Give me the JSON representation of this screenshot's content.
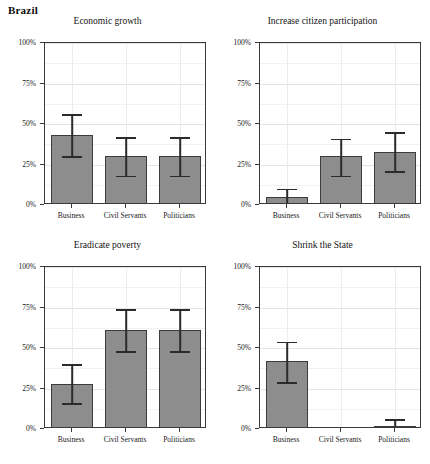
{
  "figure": {
    "country_title": "Brazil"
  },
  "axis": {
    "y_ticks": [
      "0%",
      "25%",
      "50%",
      "75%",
      "100%"
    ],
    "y_values": [
      0,
      25,
      50,
      75,
      100
    ],
    "categories": [
      "Business",
      "Civil Servants",
      "Politicians"
    ]
  },
  "panels": [
    {
      "id": "economic-growth",
      "title": "Economic growth",
      "values": [
        43,
        30,
        30
      ],
      "ci_low": [
        30,
        18,
        18
      ],
      "ci_high": [
        56,
        42,
        42
      ]
    },
    {
      "id": "increase-citizen-participation",
      "title": "Increase citizen participation",
      "values": [
        5,
        30,
        33
      ],
      "ci_low": [
        0,
        18,
        21
      ],
      "ci_high": [
        10,
        41,
        45
      ]
    },
    {
      "id": "eradicate-poverty",
      "title": "Eradicate poverty",
      "values": [
        28,
        61,
        61
      ],
      "ci_low": [
        16,
        48,
        48
      ],
      "ci_high": [
        40,
        74,
        74
      ]
    },
    {
      "id": "shrink-the-state",
      "title": "Shrink the State",
      "values": [
        42,
        0,
        2
      ],
      "ci_low": [
        29,
        0,
        0
      ],
      "ci_high": [
        54,
        0,
        6
      ]
    }
  ],
  "chart_data": {
    "type": "bar",
    "title": "Brazil",
    "xlabel": "",
    "ylabel": "",
    "ylim": [
      0,
      100
    ],
    "grid": true,
    "legend": "none",
    "categories": [
      "Business",
      "Civil Servants",
      "Politicians"
    ],
    "ytick_labels": [
      "0%",
      "25%",
      "50%",
      "75%",
      "100%"
    ],
    "error_bars": "95% confidence interval",
    "panels": [
      {
        "title": "Economic growth",
        "series": [
          {
            "name": "Business",
            "value": 43,
            "ci_low": 30,
            "ci_high": 56
          },
          {
            "name": "Civil Servants",
            "value": 30,
            "ci_low": 18,
            "ci_high": 42
          },
          {
            "name": "Politicians",
            "value": 30,
            "ci_low": 18,
            "ci_high": 42
          }
        ]
      },
      {
        "title": "Increase citizen participation",
        "series": [
          {
            "name": "Business",
            "value": 5,
            "ci_low": 0,
            "ci_high": 10
          },
          {
            "name": "Civil Servants",
            "value": 30,
            "ci_low": 18,
            "ci_high": 41
          },
          {
            "name": "Politicians",
            "value": 33,
            "ci_low": 21,
            "ci_high": 45
          }
        ]
      },
      {
        "title": "Eradicate poverty",
        "series": [
          {
            "name": "Business",
            "value": 28,
            "ci_low": 16,
            "ci_high": 40
          },
          {
            "name": "Civil Servants",
            "value": 61,
            "ci_low": 48,
            "ci_high": 74
          },
          {
            "name": "Politicians",
            "value": 61,
            "ci_low": 48,
            "ci_high": 74
          }
        ]
      },
      {
        "title": "Shrink the State",
        "series": [
          {
            "name": "Business",
            "value": 42,
            "ci_low": 29,
            "ci_high": 54
          },
          {
            "name": "Civil Servants",
            "value": 0,
            "ci_low": 0,
            "ci_high": 0
          },
          {
            "name": "Politicians",
            "value": 2,
            "ci_low": 0,
            "ci_high": 6
          }
        ]
      }
    ]
  }
}
